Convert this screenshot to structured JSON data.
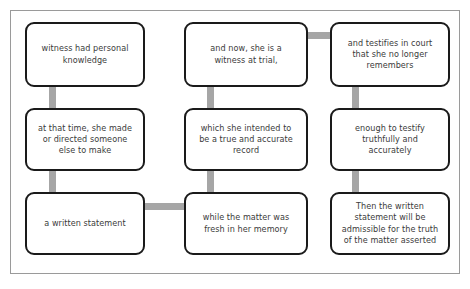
{
  "diagram": {
    "colors": {
      "background": "#ffffff",
      "frame_border": "#9a9a9a",
      "box_border": "#1a1a1a",
      "box_fill": "#ffffff",
      "connector": "#a6a6a6",
      "text": "#3b3b3b"
    },
    "nodes": [
      {
        "id": "n1",
        "grid": "row1-col1",
        "text": "witness had personal\nknowledge"
      },
      {
        "id": "n2",
        "grid": "row1-col2",
        "text": "and now, she is a\nwitness at trial,"
      },
      {
        "id": "n3",
        "grid": "row1-col3",
        "text": "and testifies in court\nthat she no longer\nremembers"
      },
      {
        "id": "n4",
        "grid": "row2-col1",
        "text": "at that time, she made\nor directed someone\nelse to make"
      },
      {
        "id": "n5",
        "grid": "row2-col2",
        "text": "which she intended to\nbe a true and accurate\nrecord"
      },
      {
        "id": "n6",
        "grid": "row2-col3",
        "text": "enough to testify\ntruthfully and\naccurately"
      },
      {
        "id": "n7",
        "grid": "row3-col1",
        "text": "a written statement"
      },
      {
        "id": "n8",
        "grid": "row3-col2",
        "text": "while the matter was\nfresh in her memory"
      },
      {
        "id": "n9",
        "grid": "row3-col3",
        "text": "Then the written\nstatement will be\nadmissible for the truth\nof the matter asserted"
      }
    ],
    "connectors": [
      {
        "id": "c1",
        "from": "n1",
        "to": "n4",
        "orientation": "vertical"
      },
      {
        "id": "c2",
        "from": "n4",
        "to": "n7",
        "orientation": "vertical"
      },
      {
        "id": "c3",
        "from": "n2",
        "to": "n5",
        "orientation": "vertical"
      },
      {
        "id": "c4",
        "from": "n5",
        "to": "n8",
        "orientation": "vertical"
      },
      {
        "id": "c5",
        "from": "n3",
        "to": "n6",
        "orientation": "vertical"
      },
      {
        "id": "c6",
        "from": "n6",
        "to": "n9",
        "orientation": "vertical"
      },
      {
        "id": "c7",
        "from": "n2",
        "to": "n3",
        "orientation": "horizontal"
      },
      {
        "id": "c8",
        "from": "n7",
        "to": "n8",
        "orientation": "horizontal"
      }
    ]
  }
}
